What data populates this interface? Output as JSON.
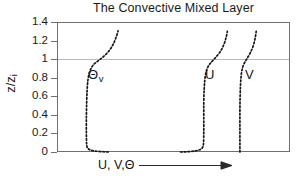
{
  "chart_data": {
    "type": "line",
    "title": "The Convective Mixed Layer",
    "xlabel": "U, V,Θ",
    "ylabel": "z/z",
    "ylabel_sub": "i",
    "xlim": null,
    "ylim": [
      0,
      1.4
    ],
    "x_axis_numeric": false,
    "x_axis_arrow": true,
    "grid": false,
    "reference_lines": [
      {
        "axis": "y",
        "value": 1,
        "color": "#b9babc",
        "label": ""
      }
    ],
    "yticks": [
      0,
      0.2,
      0.4,
      0.6,
      0.8,
      1,
      1.2,
      1.4
    ],
    "ytick_labels": [
      "0",
      "0.2",
      "0.4",
      "0.6",
      "0.8",
      "1",
      "1.2",
      "1.4"
    ],
    "linestyle": "dotted",
    "legend_position": "inline-annotations",
    "annotations": [
      {
        "name": "theta-v",
        "text": "Θ",
        "sub": "v",
        "x_frac": 0.133,
        "y_value": 0.83
      },
      {
        "name": "u",
        "text": "U",
        "sub": "",
        "x_frac": 0.635,
        "y_value": 0.83
      },
      {
        "name": "v",
        "text": "V",
        "sub": "",
        "x_frac": 0.807,
        "y_value": 0.83
      }
    ],
    "series": [
      {
        "name": "Θv",
        "label": "Θv",
        "description": "Virtual potential temperature profile: superadiabatic surface layer curving right near the ground, well-mixed near-constant layer through the mixed layer, stable capping inversion bending right above z/zi = 1",
        "points": [
          {
            "x_frac": 0.22,
            "y": 0.0
          },
          {
            "x_frac": 0.185,
            "y": 0.005
          },
          {
            "x_frac": 0.16,
            "y": 0.012
          },
          {
            "x_frac": 0.143,
            "y": 0.022
          },
          {
            "x_frac": 0.134,
            "y": 0.035
          },
          {
            "x_frac": 0.129,
            "y": 0.055
          },
          {
            "x_frac": 0.127,
            "y": 0.09
          },
          {
            "x_frac": 0.126,
            "y": 0.2
          },
          {
            "x_frac": 0.126,
            "y": 0.35
          },
          {
            "x_frac": 0.127,
            "y": 0.5
          },
          {
            "x_frac": 0.129,
            "y": 0.65
          },
          {
            "x_frac": 0.133,
            "y": 0.78
          },
          {
            "x_frac": 0.141,
            "y": 0.87
          },
          {
            "x_frac": 0.155,
            "y": 0.935
          },
          {
            "x_frac": 0.178,
            "y": 0.985
          },
          {
            "x_frac": 0.205,
            "y": 1.04
          },
          {
            "x_frac": 0.228,
            "y": 1.105
          },
          {
            "x_frac": 0.245,
            "y": 1.18
          },
          {
            "x_frac": 0.257,
            "y": 1.26
          },
          {
            "x_frac": 0.262,
            "y": 1.305
          }
        ]
      },
      {
        "name": "U",
        "label": "U",
        "description": "Along-wind component: shear layer curving left near the surface, near-uniform through the mixed layer, turning right above z/zi = 1 toward the geostrophic value",
        "points": [
          {
            "x_frac": 0.53,
            "y": 0.0
          },
          {
            "x_frac": 0.565,
            "y": 0.004
          },
          {
            "x_frac": 0.593,
            "y": 0.012
          },
          {
            "x_frac": 0.612,
            "y": 0.024
          },
          {
            "x_frac": 0.622,
            "y": 0.04
          },
          {
            "x_frac": 0.627,
            "y": 0.062
          },
          {
            "x_frac": 0.629,
            "y": 0.1
          },
          {
            "x_frac": 0.63,
            "y": 0.22
          },
          {
            "x_frac": 0.63,
            "y": 0.38
          },
          {
            "x_frac": 0.63,
            "y": 0.54
          },
          {
            "x_frac": 0.632,
            "y": 0.69
          },
          {
            "x_frac": 0.636,
            "y": 0.81
          },
          {
            "x_frac": 0.644,
            "y": 0.895
          },
          {
            "x_frac": 0.658,
            "y": 0.955
          },
          {
            "x_frac": 0.678,
            "y": 1.01
          },
          {
            "x_frac": 0.699,
            "y": 1.075
          },
          {
            "x_frac": 0.715,
            "y": 1.15
          },
          {
            "x_frac": 0.726,
            "y": 1.235
          },
          {
            "x_frac": 0.731,
            "y": 1.3
          }
        ]
      },
      {
        "name": "V",
        "label": "V",
        "description": "Cross-wind component: essentially constant with height through the mixed layer, bending right within the entrainment zone above z/zi = 1",
        "points": [
          {
            "x_frac": 0.785,
            "y": 0.0
          },
          {
            "x_frac": 0.785,
            "y": 0.12
          },
          {
            "x_frac": 0.785,
            "y": 0.28
          },
          {
            "x_frac": 0.785,
            "y": 0.44
          },
          {
            "x_frac": 0.786,
            "y": 0.6
          },
          {
            "x_frac": 0.788,
            "y": 0.74
          },
          {
            "x_frac": 0.792,
            "y": 0.855
          },
          {
            "x_frac": 0.8,
            "y": 0.935
          },
          {
            "x_frac": 0.814,
            "y": 1.0
          },
          {
            "x_frac": 0.83,
            "y": 1.07
          },
          {
            "x_frac": 0.843,
            "y": 1.15
          },
          {
            "x_frac": 0.851,
            "y": 1.235
          },
          {
            "x_frac": 0.855,
            "y": 1.3
          }
        ]
      }
    ]
  }
}
